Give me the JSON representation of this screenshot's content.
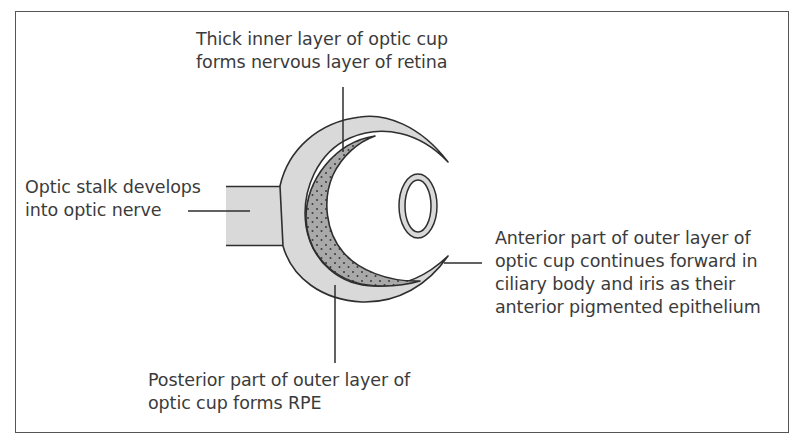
{
  "figure": {
    "colors": {
      "outer_layer_fill": "#d9d9d9",
      "inner_layer_fill": "#a8a8a8",
      "stroke": "#2e2e2e",
      "text": "#3b3b3b"
    }
  },
  "labels": {
    "inner_layer": {
      "lines": [
        "Thick inner layer of optic cup",
        "forms nervous layer of retina"
      ]
    },
    "optic_stalk": {
      "lines": [
        "Optic stalk develops",
        "into optic nerve"
      ]
    },
    "anterior_outer": {
      "lines": [
        "Anterior part of outer layer of",
        "optic cup continues forward in",
        "ciliary body and iris as their",
        "anterior pigmented epithelium"
      ]
    },
    "posterior_outer": {
      "lines": [
        "Posterior part of outer layer of",
        "optic cup forms RPE"
      ]
    }
  },
  "structures": [
    {
      "name": "optic stalk",
      "shape": "rectangle"
    },
    {
      "name": "outer layer of optic cup",
      "shape": "crescent",
      "fill": "light gray"
    },
    {
      "name": "inner layer of optic cup",
      "shape": "crescent",
      "fill": "stippled gray"
    },
    {
      "name": "lens vesicle",
      "shape": "ellipse ring"
    }
  ]
}
